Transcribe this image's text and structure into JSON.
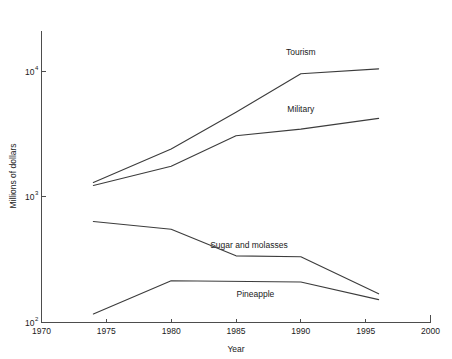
{
  "chart_data": {
    "type": "line",
    "title": "",
    "xlabel": "Year",
    "ylabel": "Millions of dollars",
    "xlim": [
      1970,
      2000
    ],
    "ylim": [
      100,
      21000
    ],
    "yscale": "log",
    "xscale": "linear",
    "grid": false,
    "legend_position": "inline-annotations",
    "xticks": [
      1970,
      1975,
      1980,
      1985,
      1990,
      1995,
      2000
    ],
    "xtick_labels": [
      "1970",
      "1975",
      "1980",
      "1985",
      "1990",
      "1995",
      "2000"
    ],
    "yticks": [
      100,
      1000,
      10000
    ],
    "ytick_labels": [
      "10^2",
      "10^3",
      "10^4"
    ],
    "ytick_bases": [
      "10",
      "10",
      "10"
    ],
    "ytick_exponents": [
      "2",
      "3",
      "4"
    ],
    "series": [
      {
        "name": "Tourism",
        "label": "Tourism",
        "label_x": 1990.0,
        "label_y": 13500,
        "x": [
          1974,
          1980,
          1985,
          1990,
          1996
        ],
        "values": [
          1300,
          2400,
          4700,
          9500,
          10400
        ]
      },
      {
        "name": "Military",
        "label": "Military",
        "label_x": 1990.0,
        "label_y": 4700,
        "x": [
          1974,
          1980,
          1985,
          1990,
          1996
        ],
        "values": [
          1230,
          1750,
          3060,
          3450,
          4200
        ]
      },
      {
        "name": "Sugar and molasses",
        "label": "Sugar and molasses",
        "label_x": 1986.0,
        "label_y": 390,
        "x": [
          1974,
          1980,
          1985,
          1990,
          1996
        ],
        "values": [
          636,
          552,
          339,
          333,
          169
        ]
      },
      {
        "name": "Pineapple",
        "label": "Pineapple",
        "label_x": 1986.5,
        "label_y": 160,
        "x": [
          1974,
          1980,
          1990,
          1996
        ],
        "values": [
          117,
          215,
          210,
          152
        ]
      }
    ],
    "colors": {
      "line": "#3c3c3c",
      "axis": "#4d4d4d",
      "text": "#1a1a1a",
      "background": "#ffffff"
    }
  },
  "figure": {
    "alt": "Line chart of Hawaii revenue sources in millions of dollars, 1970 to 2000, logarithmic vertical axis"
  }
}
